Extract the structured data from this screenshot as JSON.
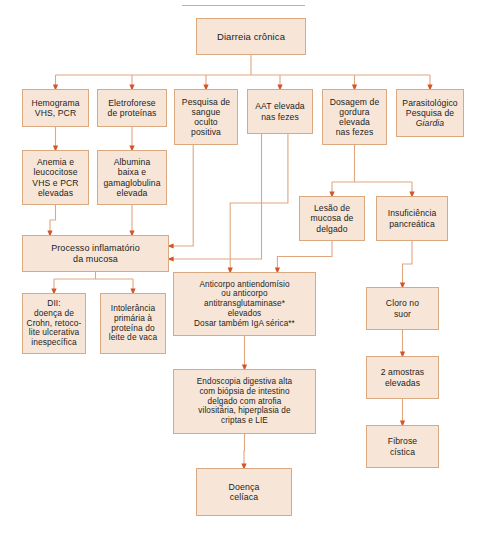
{
  "diagram": {
    "colors": {
      "node_fill": "#f7e6d7",
      "node_border": "#dba97f",
      "connector": "#e0a680",
      "arrowhead": "#d4542a",
      "text": "#1d1d1b",
      "background": "#ffffff"
    },
    "nodes": [
      {
        "id": "root",
        "label": "Diarreia crônica",
        "x": 196,
        "y": 18,
        "w": 110,
        "h": 37,
        "font": 9.5
      },
      {
        "id": "hemograma",
        "label": "Hemograma\nVHS, PCR",
        "x": 22,
        "y": 89,
        "w": 67,
        "h": 38,
        "font": 8.6
      },
      {
        "id": "eletroforese",
        "label": "Eletroforese\nde proteínas",
        "x": 97,
        "y": 89,
        "w": 70,
        "h": 38,
        "font": 8.6
      },
      {
        "id": "sangue",
        "label": "Pesquisa de\nsangue\noculto\npositiva",
        "x": 174,
        "y": 89,
        "w": 64,
        "h": 56,
        "font": 8.6
      },
      {
        "id": "aat",
        "label": "AAT elevada\nnas fezes",
        "x": 247,
        "y": 89,
        "w": 66,
        "h": 45,
        "font": 8.6
      },
      {
        "id": "gordura",
        "label": "Dosagem de\ngordura\nelevada\nnas fezes",
        "x": 322,
        "y": 89,
        "w": 65,
        "h": 56,
        "font": 8.6
      },
      {
        "id": "parasito",
        "label": "Parasitológico\nPesquisa de\nGiardia",
        "x": 396,
        "y": 89,
        "w": 68,
        "h": 48,
        "font": 8.6,
        "italic_last": true
      },
      {
        "id": "anemia",
        "label": "Anemia e\nleucocitose\nVHS e PCR\nelevadas",
        "x": 22,
        "y": 150,
        "w": 67,
        "h": 55,
        "font": 8.6
      },
      {
        "id": "albumina",
        "label": "Albumina\nbaixa e\ngamaglobulina\nelevada",
        "x": 97,
        "y": 150,
        "w": 70,
        "h": 55,
        "font": 8.6
      },
      {
        "id": "lesao",
        "label": "Lesão de\nmucosa de\ndelgado",
        "x": 299,
        "y": 196,
        "w": 66,
        "h": 45,
        "font": 8.6
      },
      {
        "id": "insuf",
        "label": "Insuficiência\npancreática",
        "x": 376,
        "y": 196,
        "w": 72,
        "h": 45,
        "font": 8.6
      },
      {
        "id": "processo",
        "label": "Processo inflamatório\nda mucosa",
        "x": 22,
        "y": 235,
        "w": 147,
        "h": 37,
        "font": 9.0
      },
      {
        "id": "dii",
        "label": "DII:\ndoença de\nCrohn, retoco-\nlite ulcerativa\ninespecífica",
        "x": 22,
        "y": 293,
        "w": 64,
        "h": 61,
        "font": 8.4
      },
      {
        "id": "intoleranca",
        "label": "Intolerância\nprimária à\nproteína do\nleite de vaca",
        "x": 100,
        "y": 293,
        "w": 66,
        "h": 61,
        "font": 8.4
      },
      {
        "id": "anticorpo",
        "label": "Anticorpo antiendomísio\nou anticorpo\nantitransglutaminase*\nelevados\nDosar também IgA sérica**",
        "x": 173,
        "y": 272,
        "w": 143,
        "h": 64,
        "font": 8.2
      },
      {
        "id": "cloro",
        "label": "Cloro no\nsuor",
        "x": 366,
        "y": 287,
        "w": 73,
        "h": 43,
        "font": 8.6
      },
      {
        "id": "endoscopia",
        "label": "Endoscopia digestiva alta\ncom biópsia de intestino\ndelgado com atrofia\nvilositária, hiperplasia de\ncriptas e LIE",
        "x": 173,
        "y": 369,
        "w": 143,
        "h": 65,
        "font": 8.2
      },
      {
        "id": "amostras",
        "label": "2 amostras\nelevadas",
        "x": 366,
        "y": 356,
        "w": 73,
        "h": 43,
        "font": 8.6
      },
      {
        "id": "fibrose",
        "label": "Fibrose\ncística",
        "x": 366,
        "y": 425,
        "w": 73,
        "h": 43,
        "font": 8.6
      },
      {
        "id": "celiaca",
        "label": "Doença\ncelíaca",
        "x": 196,
        "y": 468,
        "w": 96,
        "h": 48,
        "font": 8.8
      }
    ],
    "edges": [
      {
        "from": "root",
        "to": "hemograma",
        "type": "fan"
      },
      {
        "from": "root",
        "to": "eletroforese",
        "type": "fan"
      },
      {
        "from": "root",
        "to": "sangue",
        "type": "fan"
      },
      {
        "from": "root",
        "to": "aat",
        "type": "fan"
      },
      {
        "from": "root",
        "to": "gordura",
        "type": "fan"
      },
      {
        "from": "root",
        "to": "parasito",
        "type": "fan"
      },
      {
        "from": "hemograma",
        "to": "anemia",
        "type": "vertical"
      },
      {
        "from": "eletroforese",
        "to": "albumina",
        "type": "vertical"
      },
      {
        "from": "anemia",
        "to": "processo",
        "type": "vertical"
      },
      {
        "from": "albumina",
        "to": "processo",
        "type": "vertical"
      },
      {
        "from": "sangue",
        "to": "processo",
        "type": "elbow-left"
      },
      {
        "from": "aat",
        "to": "processo",
        "type": "elbow-left"
      },
      {
        "from": "aat",
        "to": "anticorpo",
        "type": "vertical"
      },
      {
        "from": "gordura",
        "to": "lesao",
        "type": "fan"
      },
      {
        "from": "gordura",
        "to": "insuf",
        "type": "fan"
      },
      {
        "from": "lesao",
        "to": "anticorpo",
        "type": "vertical"
      },
      {
        "from": "insuf",
        "to": "cloro",
        "type": "vertical"
      },
      {
        "from": "processo",
        "to": "dii",
        "type": "fan"
      },
      {
        "from": "processo",
        "to": "intoleranca",
        "type": "fan"
      },
      {
        "from": "anticorpo",
        "to": "endoscopia",
        "type": "vertical"
      },
      {
        "from": "endoscopia",
        "to": "celiaca",
        "type": "vertical"
      },
      {
        "from": "cloro",
        "to": "amostras",
        "type": "vertical"
      },
      {
        "from": "amostras",
        "to": "fibrose",
        "type": "vertical"
      }
    ]
  }
}
